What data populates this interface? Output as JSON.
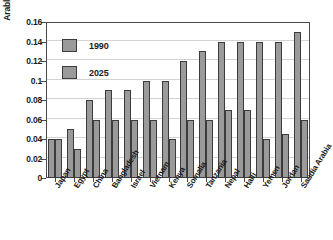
{
  "chart_data": {
    "type": "bar",
    "title": "",
    "xlabel": "",
    "ylabel": "Arable hectares per capita",
    "ylim": [
      0,
      0.16
    ],
    "ytick_labels": [
      "0.16",
      "0.14",
      "0.12",
      "0.1",
      "0.08",
      "0.06",
      "0.04",
      "0.02",
      "0"
    ],
    "ytick_values": [
      0.16,
      0.14,
      0.12,
      0.1,
      0.08,
      0.06,
      0.04,
      0.02,
      0
    ],
    "grid": true,
    "legend_position": "top-left-inside",
    "categories": [
      "Japan",
      "Egypt",
      "China",
      "Bangladesh",
      "Israel",
      "Vietnam",
      "Kenya",
      "Somalia",
      "Tanzania",
      "Nepal",
      "Haiti",
      "Yemen",
      "Jordan",
      "Saudia Arabia"
    ],
    "series": [
      {
        "name": "1990",
        "values": [
          0.04,
          0.05,
          0.08,
          0.09,
          0.09,
          0.1,
          0.1,
          0.12,
          0.13,
          0.14,
          0.14,
          0.14,
          0.14,
          0.15
        ]
      },
      {
        "name": "2025",
        "values": [
          0.04,
          0.03,
          0.06,
          0.06,
          0.06,
          0.06,
          0.04,
          0.06,
          0.06,
          0.07,
          0.07,
          0.04,
          0.045,
          0.06
        ]
      }
    ]
  },
  "legend": {
    "entries": [
      {
        "label": "1990"
      },
      {
        "label": "2025"
      }
    ]
  },
  "colors": {
    "bar_fill": "#9a9a9a",
    "bar_stroke": "#3c3c3c",
    "gridline": "#d3d3d3",
    "axis": "#4a4a4a",
    "text": "#1a1a1a",
    "background": "#ffffff"
  }
}
